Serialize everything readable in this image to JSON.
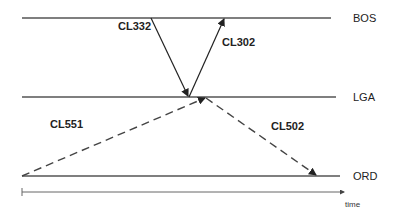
{
  "airports": [
    {
      "code": "BOS",
      "y": 18
    },
    {
      "code": "LGA",
      "y": 97
    },
    {
      "code": "ORD",
      "y": 176
    }
  ],
  "flights": [
    {
      "id": "CL332",
      "from": "BOS",
      "to": "LGA",
      "style": "solid"
    },
    {
      "id": "CL302",
      "from": "LGA",
      "to": "BOS",
      "style": "solid"
    },
    {
      "id": "CL551",
      "from": "ORD",
      "to": "LGA",
      "style": "dashed"
    },
    {
      "id": "CL502",
      "from": "LGA",
      "to": "ORD",
      "style": "dashed"
    }
  ],
  "axis": {
    "label": "time"
  },
  "colors": {
    "line": "#555555",
    "text": "#222222"
  }
}
